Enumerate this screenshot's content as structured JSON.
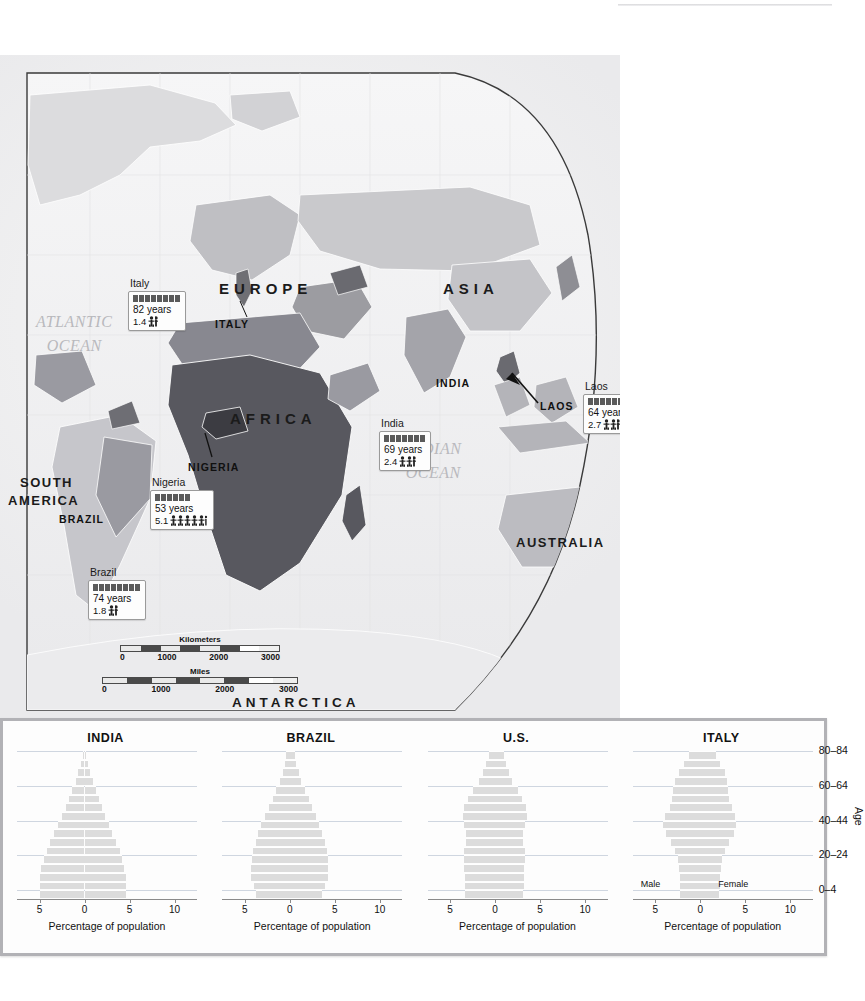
{
  "page": {
    "background_color": "#ffffff",
    "width": 832,
    "height": 1001
  },
  "map": {
    "ocean_labels": [
      {
        "name": "atlantic-ocean",
        "line1": "ATLANTIC",
        "line2": "OCEAN",
        "x": 36,
        "y": 255
      },
      {
        "name": "pacific-ocean",
        "line1": "PACIFIC",
        "line2": "OCEAN",
        "x": 655,
        "y": 310
      },
      {
        "name": "indian-ocean",
        "line1": "INDIAN",
        "line2": "OCEAN",
        "x": 405,
        "y": 382
      }
    ],
    "continent_labels": [
      {
        "name": "europe",
        "text": "EUROPE",
        "x": 219,
        "y": 225
      },
      {
        "name": "asia",
        "text": "ASIA",
        "x": 443,
        "y": 225
      },
      {
        "name": "africa",
        "text": "AFRICA",
        "x": 230,
        "y": 355
      },
      {
        "name": "south-america",
        "text": "SOUTH",
        "x": 20,
        "y": 420
      },
      {
        "name": "south-america-2",
        "text": "AMERICA",
        "x": 8,
        "y": 438
      },
      {
        "name": "australia",
        "text": "AUSTRALIA",
        "x": 516,
        "y": 480
      },
      {
        "name": "antarctica",
        "text": "ANTARCTICA",
        "x": 232,
        "y": 698
      }
    ],
    "country_labels": [
      {
        "name": "italy",
        "text": "ITALY",
        "x": 215,
        "y": 263
      },
      {
        "name": "nigeria",
        "text": "NIGERIA",
        "x": 188,
        "y": 406
      },
      {
        "name": "india",
        "text": "INDIA",
        "x": 436,
        "y": 322
      },
      {
        "name": "laos",
        "text": "LAOS",
        "x": 540,
        "y": 345
      },
      {
        "name": "brazil",
        "text": "BRAZIL",
        "x": 59,
        "y": 458
      }
    ],
    "callouts": [
      {
        "name": "callout-italy",
        "country": "Italy",
        "life_expectancy": "82 years",
        "fertility": "1.4",
        "bar_blocks": 8,
        "people_icons": 1,
        "half_icon": true,
        "x": 128,
        "y": 222
      },
      {
        "name": "callout-india",
        "country": "India",
        "life_expectancy": "69 years",
        "fertility": "2.4",
        "bar_blocks": 7,
        "people_icons": 2,
        "half_icon": true,
        "x": 379,
        "y": 362
      },
      {
        "name": "callout-laos",
        "country": "Laos",
        "life_expectancy": "64 years",
        "fertility": "2.7",
        "bar_blocks": 7,
        "people_icons": 2,
        "half_icon": true,
        "x": 583,
        "y": 325
      },
      {
        "name": "callout-nigeria",
        "country": "Nigeria",
        "life_expectancy": "53 years",
        "fertility": "5.1",
        "bar_blocks": 6,
        "people_icons": 5,
        "half_icon": false,
        "x": 150,
        "y": 421
      },
      {
        "name": "callout-brazil",
        "country": "Brazil",
        "life_expectancy": "74 years",
        "fertility": "1.8",
        "bar_blocks": 8,
        "people_icons": 1,
        "half_icon": true,
        "x": 88,
        "y": 511
      }
    ],
    "scale": {
      "kilometers": {
        "label": "Kilometers",
        "ticks": [
          "0",
          "1000",
          "2000",
          "3000"
        ]
      },
      "miles": {
        "label": "Miles",
        "ticks": [
          "0",
          "1000",
          "2000",
          "3000"
        ]
      }
    }
  },
  "chart_data": [
    {
      "type": "bar",
      "name": "india-pyramid",
      "title": "INDIA",
      "xlabel": "Percentage of population",
      "ylabel": "Age",
      "xticks": [
        "5",
        "0",
        "5",
        "10"
      ],
      "xlim": [
        -7.5,
        12.5
      ],
      "age_groups": [
        "0–4",
        "5–9",
        "10–14",
        "15–19",
        "20–24",
        "25–29",
        "30–34",
        "35–39",
        "40–44",
        "45–49",
        "50–54",
        "55–59",
        "60–64",
        "65–69",
        "70–74",
        "75–79",
        "80–84"
      ],
      "series": [
        {
          "name": "Male",
          "values": [
            4.9,
            4.9,
            5.0,
            4.8,
            4.5,
            4.2,
            3.8,
            3.4,
            3.0,
            2.5,
            2.1,
            1.7,
            1.4,
            1.0,
            0.7,
            0.4,
            0.2
          ]
        },
        {
          "name": "Female",
          "values": [
            4.6,
            4.6,
            4.6,
            4.4,
            4.2,
            3.9,
            3.5,
            3.1,
            2.7,
            2.3,
            1.9,
            1.6,
            1.3,
            0.9,
            0.6,
            0.4,
            0.2
          ]
        }
      ]
    },
    {
      "type": "bar",
      "name": "brazil-pyramid",
      "title": "BRAZIL",
      "xlabel": "Percentage of population",
      "ylabel": "Age",
      "xticks": [
        "5",
        "0",
        "5",
        "10"
      ],
      "xlim": [
        -7.5,
        12.5
      ],
      "age_groups": [
        "0–4",
        "5–9",
        "10–14",
        "15–19",
        "20–24",
        "25–29",
        "30–34",
        "35–39",
        "40–44",
        "45–49",
        "50–54",
        "55–59",
        "60–64",
        "65–69",
        "70–74",
        "75–79",
        "80–84"
      ],
      "series": [
        {
          "name": "Male",
          "values": [
            3.7,
            4.0,
            4.3,
            4.3,
            4.2,
            4.1,
            3.8,
            3.5,
            3.2,
            2.8,
            2.3,
            1.9,
            1.5,
            1.1,
            0.8,
            0.5,
            0.4
          ]
        },
        {
          "name": "Female",
          "values": [
            3.6,
            3.9,
            4.2,
            4.2,
            4.2,
            4.1,
            3.9,
            3.6,
            3.3,
            2.9,
            2.5,
            2.1,
            1.7,
            1.3,
            1.0,
            0.7,
            0.6
          ]
        }
      ]
    },
    {
      "type": "bar",
      "name": "us-pyramid",
      "title": "U.S.",
      "xlabel": "Percentage of population",
      "ylabel": "Age",
      "xticks": [
        "5",
        "0",
        "5",
        "10"
      ],
      "xlim": [
        -7.5,
        12.5
      ],
      "age_groups": [
        "0–4",
        "5–9",
        "10–14",
        "15–19",
        "20–24",
        "25–29",
        "30–34",
        "35–39",
        "40–44",
        "45–49",
        "50–54",
        "55–59",
        "60–64",
        "65–69",
        "70–74",
        "75–79",
        "80–84"
      ],
      "series": [
        {
          "name": "Male",
          "values": [
            3.3,
            3.3,
            3.3,
            3.4,
            3.5,
            3.4,
            3.2,
            3.2,
            3.4,
            3.6,
            3.4,
            3.0,
            2.5,
            1.8,
            1.3,
            1.0,
            0.7
          ]
        },
        {
          "name": "Female",
          "values": [
            3.1,
            3.2,
            3.2,
            3.2,
            3.3,
            3.3,
            3.1,
            3.1,
            3.3,
            3.5,
            3.4,
            3.0,
            2.6,
            1.9,
            1.5,
            1.2,
            1.0
          ]
        }
      ]
    },
    {
      "type": "bar",
      "name": "italy-pyramid",
      "title": "ITALY",
      "xlabel": "Percentage of population",
      "ylabel": "Age",
      "xticks": [
        "5",
        "0",
        "5",
        "10"
      ],
      "xlim": [
        -7.5,
        12.5
      ],
      "age_groups": [
        "0–4",
        "5–9",
        "10–14",
        "15–19",
        "20–24",
        "25–29",
        "30–34",
        "35–39",
        "40–44",
        "45–49",
        "50–54",
        "55–59",
        "60–64",
        "65–69",
        "70–74",
        "75–79",
        "80–84"
      ],
      "series": [
        {
          "name": "Male",
          "values": [
            2.2,
            2.3,
            2.3,
            2.4,
            2.5,
            2.8,
            3.3,
            3.8,
            4.1,
            3.9,
            3.4,
            3.1,
            3.0,
            2.8,
            2.4,
            1.8,
            1.2
          ]
        },
        {
          "name": "Female",
          "values": [
            2.1,
            2.2,
            2.2,
            2.3,
            2.4,
            2.7,
            3.2,
            3.7,
            4.0,
            3.9,
            3.5,
            3.2,
            3.1,
            3.0,
            2.7,
            2.2,
            1.7
          ]
        }
      ]
    }
  ],
  "chart_panel": {
    "age_tick_labels": [
      "0–4",
      "20–24",
      "40–44",
      "60–64",
      "80–84"
    ],
    "age_axis_title": "Age",
    "sex_labels": {
      "male": "Male",
      "female": "Female"
    },
    "x_caption": "Percentage of population",
    "xticks": [
      "5",
      "0",
      "5",
      "10"
    ]
  },
  "colors": {
    "bar_fill": "#dcdcdc",
    "gridline": "#cfd6e0",
    "panel_border": "#b2b2b6",
    "ocean_text": "#b9b9bd",
    "land_dark": "#555555"
  }
}
